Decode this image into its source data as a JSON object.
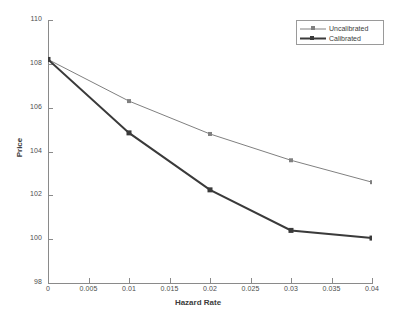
{
  "chart_data": {
    "type": "line",
    "title": "",
    "xlabel": "Hazard Rate",
    "ylabel": "Price",
    "xlim": [
      0,
      0.04
    ],
    "ylim": [
      98,
      110
    ],
    "xticks": [
      "0",
      "0.005",
      "0.01",
      "0.015",
      "0.02",
      "0.025",
      "0.03",
      "0.035",
      "0.04"
    ],
    "xtick_values": [
      0,
      0.005,
      0.01,
      0.015,
      0.02,
      0.025,
      0.03,
      0.035,
      0.04
    ],
    "yticks": [
      "98",
      "100",
      "102",
      "104",
      "106",
      "108",
      "110"
    ],
    "ytick_values": [
      98,
      100,
      102,
      104,
      106,
      108,
      110
    ],
    "grid": false,
    "legend_position": "top-right",
    "x": [
      0,
      0.01,
      0.02,
      0.03,
      0.04
    ],
    "series": [
      {
        "name": "Uncalibrated",
        "color": "#808080",
        "linewidth": 1,
        "marker": "square",
        "values": [
          108.2,
          106.3,
          104.8,
          103.6,
          102.6
        ]
      },
      {
        "name": "Calibrated",
        "color": "#3a3a3a",
        "linewidth": 2,
        "marker": "square",
        "values": [
          108.2,
          104.85,
          102.25,
          100.4,
          100.05
        ]
      }
    ]
  },
  "legend": {
    "entries": [
      {
        "label": "Uncalibrated"
      },
      {
        "label": "Calibrated"
      }
    ]
  },
  "axes": {
    "x_title": "Hazard Rate",
    "y_title": "Price",
    "x_tick_labels": [
      "0",
      "0.005",
      "0.01",
      "0.015",
      "0.02",
      "0.025",
      "0.03",
      "0.035",
      "0.04"
    ],
    "y_tick_labels": [
      "98",
      "100",
      "102",
      "104",
      "106",
      "108",
      "110"
    ]
  },
  "colors": {
    "axis": "#8a8a8a",
    "text": "#3d3d3d",
    "uncalibrated": "#808080",
    "calibrated": "#3a3a3a",
    "background": "#ffffff"
  }
}
